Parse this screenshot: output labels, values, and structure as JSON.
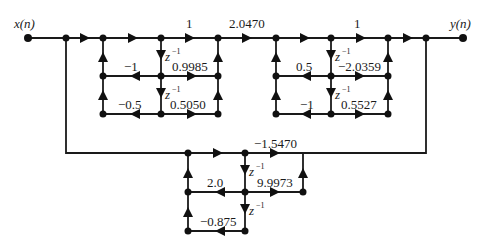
{
  "diagram": {
    "type": "signal-flow-graph",
    "input_label": "x(n)",
    "output_label": "y(n)",
    "delay_label": "z",
    "delay_exp": "−1",
    "stage1": {
      "forward_gain": "1",
      "output_gain": "2.0470",
      "feedback_1": "−1",
      "feedforward_1": "0.9985",
      "feedback_2": "−0.5",
      "feedforward_2": "0.5050"
    },
    "stage2": {
      "forward_gain": "1",
      "feedback_1": "0.5",
      "feedforward_1": "−2.0359",
      "feedback_2": "−1",
      "feedforward_2": "0.5527"
    },
    "stage3": {
      "forward_gain": "−1.5470",
      "feedback_1": "2.0",
      "feedforward_1": "9.9973",
      "feedback_2": "−0.875"
    }
  }
}
